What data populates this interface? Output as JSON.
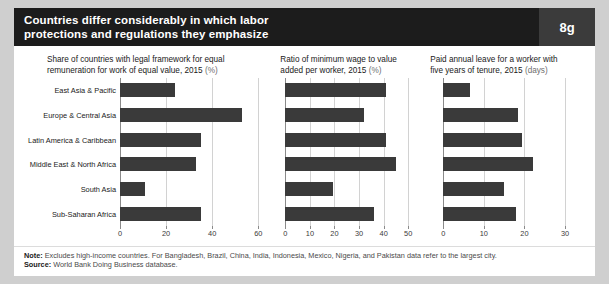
{
  "header": {
    "title_line1": "Countries differ considerably in which labor",
    "title_line2": "protections and regulations they emphasize",
    "badge": "8g"
  },
  "footer": {
    "note_label": "Note:",
    "note_text": " Excludes high-income countries. For Bangladesh, Brazil, China, India, Indonesia, Mexico, Nigeria, and Pakistan data refer to the largest city.",
    "source_label": "Source:",
    "source_text": " World Bank Doing Business database."
  },
  "categories": [
    "East Asia & Pacific",
    "Europe & Central Asia",
    "Latin America & Caribbean",
    "Middle East & North Africa",
    "South Asia",
    "Sub-Saharan Africa"
  ],
  "colors": {
    "bar": "#3a3a3a",
    "header_bg": "#1c1c1c",
    "badge_bg": "#3b3b3b",
    "grid": "#d2d2d2"
  },
  "chart_data": [
    {
      "type": "bar",
      "orientation": "horizontal",
      "title": "Share of countries with legal framework for equal remuneration for work of equal value, 2015",
      "title_line1": "Share of countries with legal framework for equal",
      "title_line2": "remuneration for work of equal value, 2015",
      "unit": "(%)",
      "categories": [
        "East Asia & Pacific",
        "Europe & Central Asia",
        "Latin America & Caribbean",
        "Middle East & North Africa",
        "South Asia",
        "Sub-Saharan Africa"
      ],
      "values": [
        24,
        53,
        35,
        33,
        11,
        35
      ],
      "xlabel": "",
      "ylabel": "",
      "xlim": [
        0,
        60
      ],
      "ticks": [
        0,
        20,
        40,
        60
      ],
      "tick_labels": [
        "0",
        "20",
        "40",
        "60"
      ],
      "grid": true,
      "legend": "none"
    },
    {
      "type": "bar",
      "orientation": "horizontal",
      "title": "Ratio of minimum wage to value added per worker, 2015",
      "title_line1": "Ratio of minimum wage to value",
      "title_line2": "added per worker, 2015",
      "unit": "(%)",
      "categories": [
        "East Asia & Pacific",
        "Europe & Central Asia",
        "Latin America & Caribbean",
        "Middle East & North Africa",
        "South Asia",
        "Sub-Saharan Africa"
      ],
      "values": [
        41,
        32,
        41,
        45,
        19.5,
        36
      ],
      "xlabel": "",
      "ylabel": "",
      "xlim": [
        0,
        50
      ],
      "ticks": [
        0,
        10,
        20,
        30,
        40,
        50
      ],
      "tick_labels": [
        "0",
        "10",
        "20",
        "30",
        "40",
        "50"
      ],
      "grid": true,
      "legend": "none"
    },
    {
      "type": "bar",
      "orientation": "horizontal",
      "title": "Paid annual leave for a worker with five years of tenure, 2015",
      "title_line1": "Paid annual leave for a worker with",
      "title_line2": "five years of tenure, 2015",
      "unit": "(days)",
      "categories": [
        "East Asia & Pacific",
        "Europe & Central Asia",
        "Latin America & Caribbean",
        "Middle East & North Africa",
        "South Asia",
        "Sub-Saharan Africa"
      ],
      "values": [
        6.5,
        18.5,
        19.5,
        22,
        15,
        18
      ],
      "xlabel": "",
      "ylabel": "",
      "xlim": [
        0,
        30
      ],
      "ticks": [
        0,
        10,
        20,
        30
      ],
      "tick_labels": [
        "0",
        "10",
        "20",
        "30"
      ],
      "grid": true,
      "legend": "none"
    }
  ]
}
